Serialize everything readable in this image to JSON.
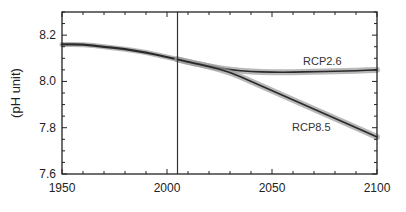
{
  "chart_data": {
    "type": "line",
    "title": "",
    "xlabel": "",
    "ylabel": "(pH unit)",
    "xlim": [
      1950,
      2100
    ],
    "ylim": [
      7.6,
      8.3
    ],
    "xticks": [
      1950,
      2000,
      2050,
      2100
    ],
    "xtick_labels": [
      "1950",
      "2000",
      "2050",
      "2100"
    ],
    "yticks": [
      7.6,
      7.8,
      8.0,
      8.2
    ],
    "ytick_labels": [
      "7.6",
      "7.8",
      "8.0",
      "8.2"
    ],
    "grid": false,
    "legend": "inline labels",
    "annotations": [
      {
        "type": "vertical_line",
        "x": 2005
      }
    ],
    "series": [
      {
        "name": "Historical",
        "label": "",
        "x": [
          1950,
          1960,
          1970,
          1980,
          1990,
          2000,
          2005
        ],
        "values": [
          8.16,
          8.16,
          8.15,
          8.14,
          8.125,
          8.105,
          8.095
        ]
      },
      {
        "name": "RCP2.6",
        "label": "RCP2.6",
        "x": [
          2005,
          2010,
          2020,
          2030,
          2040,
          2050,
          2060,
          2070,
          2080,
          2090,
          2100
        ],
        "values": [
          8.095,
          8.085,
          8.065,
          8.05,
          8.042,
          8.04,
          8.04,
          8.042,
          8.044,
          8.046,
          8.05
        ]
      },
      {
        "name": "RCP8.5",
        "label": "RCP8.5",
        "x": [
          2005,
          2010,
          2020,
          2030,
          2040,
          2050,
          2060,
          2070,
          2080,
          2090,
          2100
        ],
        "values": [
          8.095,
          8.085,
          8.065,
          8.04,
          8.0,
          7.96,
          7.92,
          7.88,
          7.84,
          7.8,
          7.76
        ]
      }
    ]
  },
  "labels": {
    "ylabel": "(pH unit)",
    "rcp26": "RCP2.6",
    "rcp85": "RCP8.5"
  }
}
